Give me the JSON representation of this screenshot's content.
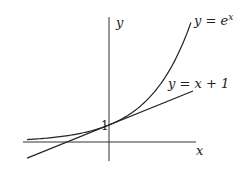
{
  "chart_data": {
    "type": "line",
    "title": "",
    "xlabel": "x",
    "ylabel": "y",
    "grid": false,
    "legend": "inline labels at curve ends",
    "xlim": [
      -2.0,
      2.1
    ],
    "ylim": [
      -1.1,
      7.2
    ],
    "annotations": [
      {
        "text": "1",
        "x": 0,
        "y": 1
      }
    ],
    "series": [
      {
        "name": "y = e^x",
        "label": "y = e",
        "label_sup": "x",
        "x": [
          -2.0,
          -1.5,
          -1.0,
          -0.5,
          0.0,
          0.5,
          1.0,
          1.5,
          1.95
        ],
        "y": [
          0.14,
          0.22,
          0.37,
          0.61,
          1.0,
          1.65,
          2.72,
          4.48,
          7.03
        ]
      },
      {
        "name": "y = x + 1",
        "label": "y = x + 1",
        "x": [
          -1.95,
          2.0
        ],
        "y": [
          -0.95,
          3.0
        ]
      }
    ]
  },
  "labels": {
    "x_axis": "x",
    "y_axis": "y",
    "one": "1",
    "exp_main": "y = e",
    "exp_sup": "x",
    "line": "y = x + 1"
  }
}
